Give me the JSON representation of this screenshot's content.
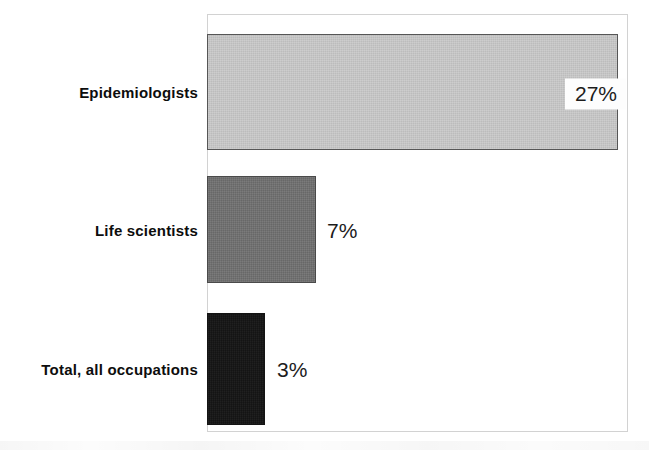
{
  "chart_data": {
    "type": "bar",
    "orientation": "horizontal",
    "title": "",
    "subtitle": "",
    "xlabel": "",
    "ylabel": "",
    "grid": false,
    "legend": null,
    "xlim": [
      0,
      27
    ],
    "categories": [
      "Epidemiologists",
      "Life scientists",
      "Total, all occupations"
    ],
    "values": [
      27,
      7,
      3
    ],
    "value_labels": [
      "27%",
      "7%",
      "3%"
    ],
    "value_label_placement": [
      "inside-end",
      "outside-end",
      "outside-end"
    ],
    "bar_colors": [
      "#c9c9c9",
      "#6e6e6e",
      "#141414"
    ],
    "bar_border_colors": [
      "#565656",
      "#4a4a4a",
      "#141414"
    ],
    "bars": [
      {
        "category": "Epidemiologists",
        "value": 27,
        "label": "27%",
        "color": "#c9c9c9"
      },
      {
        "category": "Life scientists",
        "value": 7,
        "label": "7%",
        "color": "#6e6e6e"
      },
      {
        "category": "Total, all occupations",
        "value": 3,
        "label": "3%",
        "color": "#141414"
      }
    ]
  },
  "plot": {
    "frame_border_color": "#d2d2d2",
    "background": "#ffffff",
    "label_color": "#0d0d0d",
    "value_color": "#1c1c1c"
  }
}
